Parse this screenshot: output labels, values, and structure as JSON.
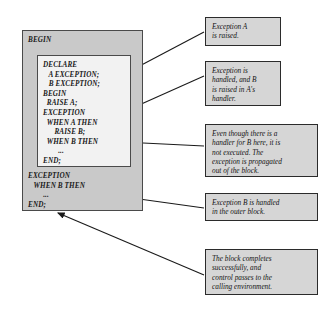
{
  "diagram": {
    "colors": {
      "outer_block_fill": "#c9c9c9",
      "inner_block_fill": "#f2f2f2",
      "callout_fill": "#d6d6d6",
      "border": "#2b2b2b",
      "arrow": "#1a1a1a",
      "page_background": "#ffffff"
    },
    "outer_block": {
      "name": "outer-plsql-block",
      "lines_before_inner": [
        "BEGIN"
      ],
      "lines_after_inner": [
        "EXCEPTION",
        "   WHEN B THEN",
        "        ...",
        "END;"
      ]
    },
    "inner_block": {
      "name": "inner-plsql-block",
      "lines": [
        "DECLARE",
        "   A EXCEPTION;",
        "   B EXCEPTION;",
        "BEGIN",
        "  RAISE A;",
        "EXCEPTION",
        "  WHEN A THEN",
        "      RAISE B;",
        "  WHEN B THEN",
        "        ...",
        "END;"
      ]
    },
    "callouts": [
      {
        "id": "callout-exception-a-raised",
        "text": "Exception  A\nis raised."
      },
      {
        "id": "callout-exception-handled",
        "text": "Exception is\nhandled, and B\nis raised in A's\nhandler."
      },
      {
        "id": "callout-handler-not-executed",
        "text": "Even though there is a\nhandler for B here, it is\nnot executed. The\nexception is propagated\nout of the block."
      },
      {
        "id": "callout-handled-outer-block",
        "text": "Exception B is handled\nin the outer block."
      },
      {
        "id": "callout-block-completes",
        "text": "The block completes\nsuccessfully, and\ncontrol passes to the\ncalling environment."
      }
    ]
  }
}
